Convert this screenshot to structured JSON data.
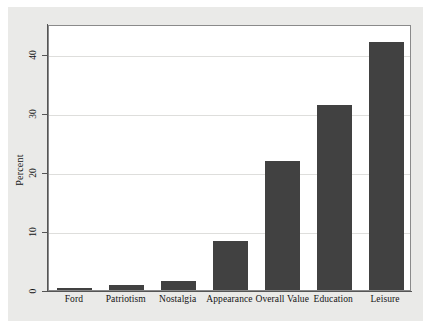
{
  "chart_data": {
    "type": "bar",
    "title": "",
    "subtitle": "",
    "xlabel": "",
    "ylabel": "Percent",
    "categories": [
      "Ford",
      "Patriotism",
      "Nostalgia",
      "Appearance",
      "Overall Value",
      "Education",
      "Leisure"
    ],
    "values": [
      0.3,
      0.8,
      1.5,
      8.3,
      21.8,
      31.3,
      42.0
    ],
    "ylim": [
      0,
      45
    ],
    "ytick_labels": [
      "0",
      "10",
      "20",
      "30",
      "40"
    ],
    "ytick_values": [
      0,
      10,
      20,
      30,
      40
    ],
    "grid": true,
    "legend": "none",
    "bar_color": "#414141",
    "plot_background": "#ffffff",
    "figure_background": "#eaeae8",
    "gridline_color": "#dededc",
    "axis_color": "#555555",
    "text_color": "#141414"
  },
  "axes": {
    "y_title": "Percent",
    "ticks": [
      {
        "label": "0",
        "value": 0
      },
      {
        "label": "10",
        "value": 10
      },
      {
        "label": "20",
        "value": 20
      },
      {
        "label": "30",
        "value": 30
      },
      {
        "label": "40",
        "value": 40
      }
    ]
  },
  "bars": [
    {
      "label": "Ford",
      "value": 0.3
    },
    {
      "label": "Patriotism",
      "value": 0.8
    },
    {
      "label": "Nostalgia",
      "value": 1.5
    },
    {
      "label": "Appearance",
      "value": 8.3
    },
    {
      "label": "Overall Value",
      "value": 21.8
    },
    {
      "label": "Education",
      "value": 31.3
    },
    {
      "label": "Leisure",
      "value": 42.0
    }
  ]
}
